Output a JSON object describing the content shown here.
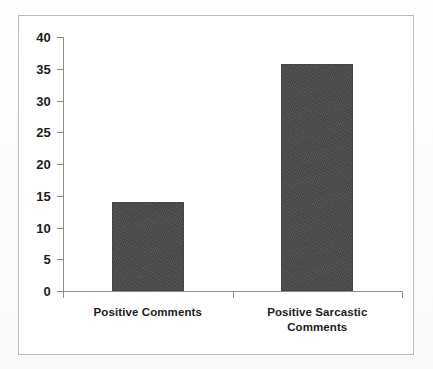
{
  "chart_data": {
    "type": "bar",
    "title": "",
    "subtitle": "",
    "xlabel": "",
    "ylabel": "",
    "categories": [
      "Positive Comments",
      "Positive Sarcastic Comments"
    ],
    "category_lines": [
      [
        "Positive Comments"
      ],
      [
        "Positive Sarcastic",
        "Comments"
      ]
    ],
    "values": [
      14,
      35.7
    ],
    "series": [
      {
        "name": "",
        "values": [
          14,
          35.7
        ]
      }
    ],
    "ylim": [
      0,
      40
    ],
    "yticks": [
      0,
      5,
      10,
      15,
      20,
      25,
      30,
      35,
      40
    ],
    "ytick_labels": [
      "0",
      "5",
      "10",
      "15",
      "20",
      "25",
      "30",
      "35",
      "40"
    ],
    "grid": false,
    "legend": false,
    "legend_position": "none",
    "bar_color": "#4a4a4a",
    "axis_color": "#8d8d8d",
    "text_color": "#1d1d1d",
    "frame_border_color": "#b9b9b9",
    "background_color": "#ffffff"
  }
}
